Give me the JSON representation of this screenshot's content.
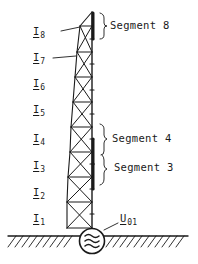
{
  "figure": {
    "type": "lattice-mast-antenna-diagram",
    "colors": {
      "ink": "#1a1a1a",
      "background": "#ffffff"
    }
  },
  "currents": [
    {
      "symbol": "I",
      "index": "1",
      "y": 226
    },
    {
      "symbol": "I",
      "index": "2",
      "y": 198
    },
    {
      "symbol": "I",
      "index": "3",
      "y": 174
    },
    {
      "symbol": "I",
      "index": "4",
      "y": 148
    },
    {
      "symbol": "I",
      "index": "5",
      "y": 122
    },
    {
      "symbol": "I",
      "index": "6",
      "y": 96
    },
    {
      "symbol": "I",
      "index": "7",
      "y": 70
    },
    {
      "symbol": "I",
      "index": "8",
      "y": 45
    }
  ],
  "segments": [
    {
      "label": "Segment 8"
    },
    {
      "label": "Segment 4"
    },
    {
      "label": "Segment 3"
    }
  ],
  "source": {
    "symbol": "U",
    "index": "01",
    "glyph": "≈",
    "icon": "ac-generator-icon"
  },
  "ground": {
    "icon": "ground-hatch-icon"
  }
}
